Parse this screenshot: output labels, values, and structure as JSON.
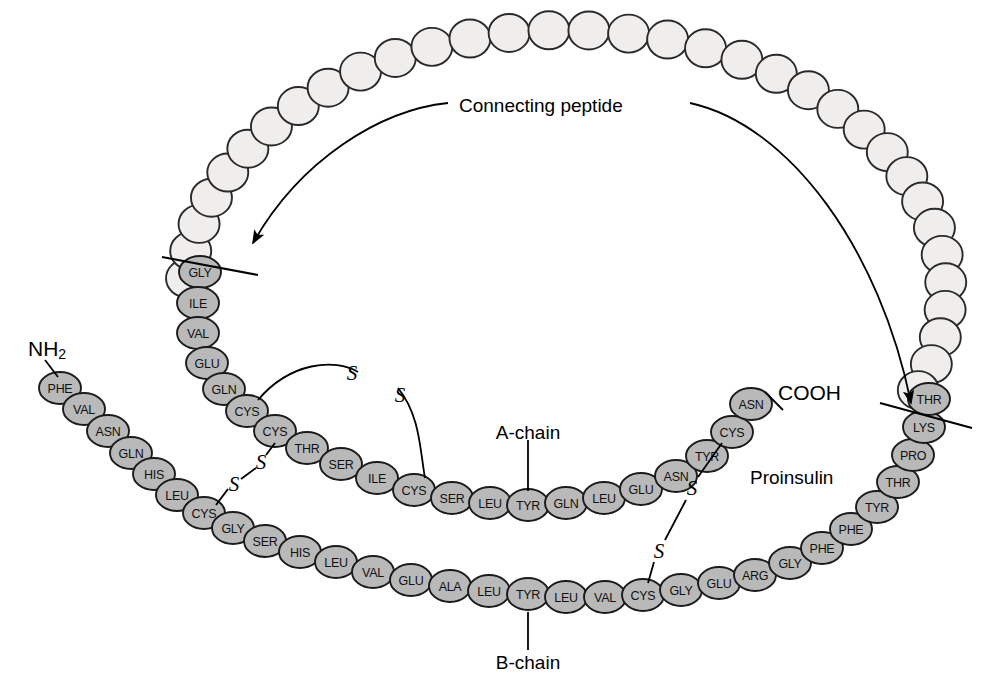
{
  "figure": {
    "title_label": "Proinsulin",
    "background_color": "#ffffff"
  },
  "annotations": {
    "connecting_peptide": "Connecting peptide",
    "a_chain": "A-chain",
    "b_chain": "B-chain",
    "proinsulin": "Proinsulin",
    "n_terminus": "NH",
    "n_terminus_sub": "2",
    "c_terminus": "COOH"
  },
  "colors": {
    "residue_fill": "#b9b9b9",
    "residue_stroke": "#1b1b1b",
    "cpeptide_fill": "#efeeec",
    "cpeptide_stroke": "#2a2a2a",
    "text": "#111111",
    "line": "#000000"
  },
  "chart_data": {
    "type": "diagram",
    "title": "Proinsulin",
    "chains": [
      {
        "name": "B-chain",
        "label": "B-chain",
        "terminus_start": "NH2",
        "residue_count": 30,
        "residues": [
          "PHE",
          "VAL",
          "ASN",
          "GLN",
          "HIS",
          "LEU",
          "CYS",
          "GLY",
          "SER",
          "HIS",
          "LEU",
          "VAL",
          "GLU",
          "ALA",
          "LEU",
          "TYR",
          "LEU",
          "VAL",
          "CYS",
          "GLY",
          "GLU",
          "ARG",
          "GLY",
          "PHE",
          "PHE",
          "TYR",
          "THR",
          "PRO",
          "LYS",
          "THR"
        ]
      },
      {
        "name": "A-chain",
        "label": "A-chain",
        "terminus_end": "COOH",
        "residue_count": 21,
        "residues": [
          "GLY",
          "ILE",
          "VAL",
          "GLU",
          "GLN",
          "CYS",
          "CYS",
          "THR",
          "SER",
          "ILE",
          "CYS",
          "SER",
          "LEU",
          "TYR",
          "GLN",
          "LEU",
          "GLU",
          "ASN",
          "TYR",
          "CYS",
          "ASN"
        ]
      },
      {
        "name": "Connecting peptide",
        "label": "Connecting peptide",
        "residue_count": 34,
        "residues_labeled": false
      }
    ],
    "disulfide_bridges": [
      {
        "name": "A6-A11 intrachain",
        "label": "S-S",
        "from": "A-chain CYS 6",
        "to": "A-chain CYS 11"
      },
      {
        "name": "B7-A7 interchain",
        "label": "S-S",
        "from": "B-chain CYS 7",
        "to": "A-chain CYS 7"
      },
      {
        "name": "B19-A20 interchain",
        "label": "S-S",
        "from": "B-chain CYS 19",
        "to": "A-chain CYS 20"
      }
    ],
    "cleavage_sites": [
      {
        "name": "left-cleavage",
        "between": "Connecting peptide and A-chain GLY 1"
      },
      {
        "name": "right-cleavage",
        "between": "Connecting peptide and B-chain THR 30"
      }
    ],
    "sulfur_atom_label": "S"
  },
  "residue_positions": {
    "b_chain": [
      {
        "label": "PHE",
        "x": 60,
        "y": 388
      },
      {
        "label": "VAL",
        "x": 84,
        "y": 409
      },
      {
        "label": "ASN",
        "x": 108,
        "y": 431
      },
      {
        "label": "GLN",
        "x": 131,
        "y": 453
      },
      {
        "label": "HIS",
        "x": 154,
        "y": 474
      },
      {
        "label": "LEU",
        "x": 177,
        "y": 495
      },
      {
        "label": "CYS",
        "x": 204,
        "y": 513
      },
      {
        "label": "GLY",
        "x": 233,
        "y": 528
      },
      {
        "label": "SER",
        "x": 265,
        "y": 541
      },
      {
        "label": "HIS",
        "x": 300,
        "y": 552
      },
      {
        "label": "LEU",
        "x": 336,
        "y": 562
      },
      {
        "label": "VAL",
        "x": 373,
        "y": 572
      },
      {
        "label": "GLU",
        "x": 411,
        "y": 580
      },
      {
        "label": "ALA",
        "x": 450,
        "y": 586
      },
      {
        "label": "LEU",
        "x": 489,
        "y": 591
      },
      {
        "label": "TYR",
        "x": 528,
        "y": 594
      },
      {
        "label": "LEU",
        "x": 566,
        "y": 597
      },
      {
        "label": "VAL",
        "x": 605,
        "y": 597
      },
      {
        "label": "CYS",
        "x": 643,
        "y": 595
      },
      {
        "label": "GLY",
        "x": 681,
        "y": 590
      },
      {
        "label": "GLU",
        "x": 719,
        "y": 583
      },
      {
        "label": "ARG",
        "x": 755,
        "y": 575
      },
      {
        "label": "GLY",
        "x": 790,
        "y": 563
      },
      {
        "label": "PHE",
        "x": 822,
        "y": 548
      },
      {
        "label": "PHE",
        "x": 851,
        "y": 529
      },
      {
        "label": "TYR",
        "x": 877,
        "y": 507
      },
      {
        "label": "THR",
        "x": 898,
        "y": 482
      },
      {
        "label": "PRO",
        "x": 913,
        "y": 455
      },
      {
        "label": "LYS",
        "x": 924,
        "y": 427
      },
      {
        "label": "THR",
        "x": 929,
        "y": 399
      }
    ],
    "a_chain": [
      {
        "label": "GLY",
        "x": 200,
        "y": 272
      },
      {
        "label": "ILE",
        "x": 198,
        "y": 303
      },
      {
        "label": "VAL",
        "x": 198,
        "y": 333
      },
      {
        "label": "GLU",
        "x": 207,
        "y": 363
      },
      {
        "label": "GLN",
        "x": 224,
        "y": 389
      },
      {
        "label": "CYS",
        "x": 247,
        "y": 411
      },
      {
        "label": "CYS",
        "x": 275,
        "y": 431
      },
      {
        "label": "THR",
        "x": 307,
        "y": 448
      },
      {
        "label": "SER",
        "x": 341,
        "y": 464
      },
      {
        "label": "ILE",
        "x": 377,
        "y": 478
      },
      {
        "label": "CYS",
        "x": 414,
        "y": 490
      },
      {
        "label": "SER",
        "x": 452,
        "y": 498
      },
      {
        "label": "LEU",
        "x": 490,
        "y": 503
      },
      {
        "label": "TYR",
        "x": 528,
        "y": 505
      },
      {
        "label": "GLN",
        "x": 566,
        "y": 503
      },
      {
        "label": "LEU",
        "x": 604,
        "y": 498
      },
      {
        "label": "GLU",
        "x": 641,
        "y": 489
      },
      {
        "label": "ASN",
        "x": 676,
        "y": 476
      },
      {
        "label": "TYR",
        "x": 707,
        "y": 456
      },
      {
        "label": "CYS",
        "x": 732,
        "y": 432
      },
      {
        "label": "ASN",
        "x": 751,
        "y": 404
      }
    ]
  }
}
